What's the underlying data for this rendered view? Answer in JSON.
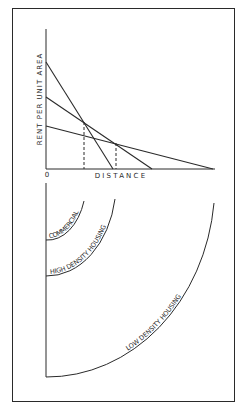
{
  "top_chart": {
    "y_label": "RENT PER UNIT AREA",
    "x_label": "DISTANCE",
    "origin_label": "0",
    "lines": [
      {
        "name": "commercial-bid-rent",
        "y_intercept_px": 62,
        "x_intercept_px": 113
      },
      {
        "name": "high-density-bid-rent",
        "y_intercept_px": 97,
        "x_intercept_px": 152
      },
      {
        "name": "low-density-bid-rent",
        "y_intercept_px": 126,
        "x_intercept_px": 213
      }
    ],
    "dashed_markers_x_px": [
      84,
      116
    ]
  },
  "bottom_zones": {
    "zones": [
      {
        "label": "COMMERCIAL"
      },
      {
        "label": "HIGH DENSITY HOUSING"
      },
      {
        "label": "LOW DENSITY HOUSING"
      }
    ]
  },
  "colors": {
    "line": "#2a2a2a",
    "background": "#ffffff"
  }
}
